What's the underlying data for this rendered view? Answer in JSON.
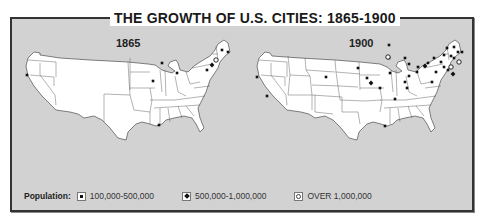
{
  "title": "THE GROWTH OF U.S. CITIES: 1865-1900",
  "colors": {
    "background": "#d2d2d2",
    "land": "#ffffff",
    "border": "#333333",
    "marker": "#111111"
  },
  "maps": [
    {
      "label": "1865",
      "cities_100k_500k": [
        {
          "x": 27,
          "y": 75
        },
        {
          "x": 162,
          "y": 63
        },
        {
          "x": 153,
          "y": 81
        },
        {
          "x": 177,
          "y": 73
        },
        {
          "x": 207,
          "y": 70
        },
        {
          "x": 222,
          "y": 50
        },
        {
          "x": 228,
          "y": 52
        },
        {
          "x": 159,
          "y": 125
        }
      ],
      "cities_500k_1m": [
        {
          "x": 212,
          "y": 65
        }
      ],
      "cities_over_1m": [
        {
          "x": 216,
          "y": 60
        }
      ]
    },
    {
      "label": "1900",
      "cities_100k_500k": [
        {
          "x": 257,
          "y": 77
        },
        {
          "x": 267,
          "y": 96
        },
        {
          "x": 326,
          "y": 77
        },
        {
          "x": 358,
          "y": 68
        },
        {
          "x": 367,
          "y": 78
        },
        {
          "x": 389,
          "y": 45
        },
        {
          "x": 389,
          "y": 58
        },
        {
          "x": 390,
          "y": 73
        },
        {
          "x": 405,
          "y": 58
        },
        {
          "x": 409,
          "y": 64
        },
        {
          "x": 409,
          "y": 76
        },
        {
          "x": 405,
          "y": 82
        },
        {
          "x": 407,
          "y": 88
        },
        {
          "x": 418,
          "y": 67
        },
        {
          "x": 417,
          "y": 72
        },
        {
          "x": 428,
          "y": 63
        },
        {
          "x": 434,
          "y": 58
        },
        {
          "x": 444,
          "y": 55
        },
        {
          "x": 451,
          "y": 56
        },
        {
          "x": 447,
          "y": 48
        },
        {
          "x": 441,
          "y": 62
        },
        {
          "x": 454,
          "y": 58
        },
        {
          "x": 458,
          "y": 52
        },
        {
          "x": 454,
          "y": 47
        },
        {
          "x": 462,
          "y": 52
        },
        {
          "x": 436,
          "y": 72
        },
        {
          "x": 432,
          "y": 82
        },
        {
          "x": 448,
          "y": 70
        },
        {
          "x": 444,
          "y": 67
        },
        {
          "x": 380,
          "y": 88
        },
        {
          "x": 395,
          "y": 99
        },
        {
          "x": 385,
          "y": 126
        }
      ],
      "cities_500k_1m": [
        {
          "x": 371,
          "y": 83
        },
        {
          "x": 425,
          "y": 66
        },
        {
          "x": 453,
          "y": 74
        }
      ],
      "cities_over_1m": [
        {
          "x": 451,
          "y": 67
        },
        {
          "x": 459,
          "y": 62
        },
        {
          "x": 388,
          "y": 57
        }
      ]
    }
  ],
  "legend": {
    "label": "Population:",
    "items": [
      {
        "label": "100,000-500,000",
        "symbol": "square-dot"
      },
      {
        "label": "500,000-1,000,000",
        "symbol": "diamond"
      },
      {
        "label": "OVER 1,000,000",
        "symbol": "circle"
      }
    ]
  }
}
